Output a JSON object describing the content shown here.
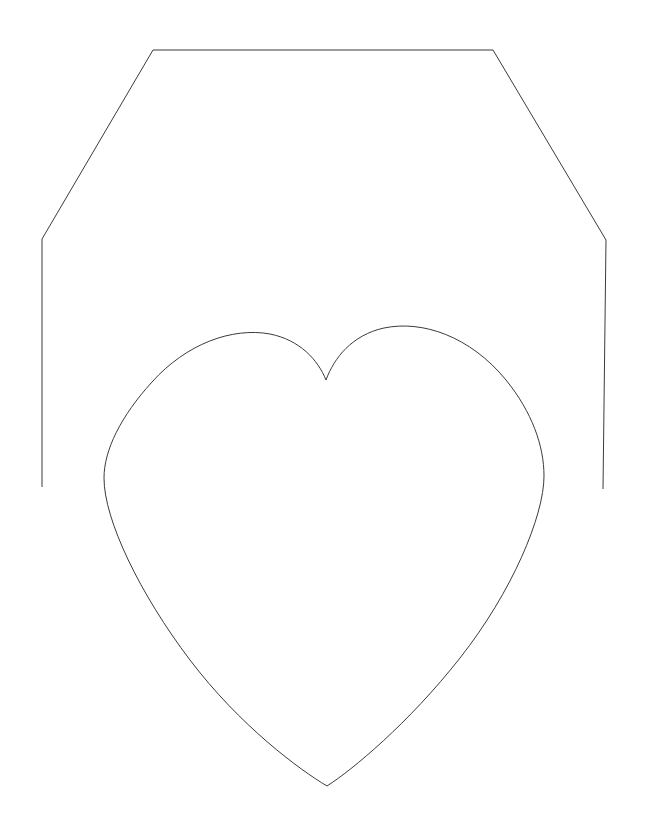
{
  "canvas": {
    "width": 645,
    "height": 837,
    "background_color": "#ffffff",
    "description": "Black-and-white line drawing: an open envelope / house-shaped outline with a large heart shape centered below"
  },
  "style": {
    "stroke_color": "#3b3b3b",
    "stroke_width": 1,
    "fill": "none"
  },
  "shapes": {
    "envelope": {
      "name": "envelope-outline",
      "type": "open-polyline",
      "stroke_color": "#3b3b3b",
      "stroke_width": 1,
      "points": [
        [
          42,
          487
        ],
        [
          42,
          239
        ],
        [
          153,
          50
        ],
        [
          493,
          50
        ],
        [
          606,
          240
        ],
        [
          603,
          489
        ]
      ],
      "path": "M 42 487 L 42 239 L 153 50 L 493 50 L 606 240 L 603 489"
    },
    "heart": {
      "name": "heart-outline",
      "type": "closed-curve",
      "stroke_color": "#3b3b3b",
      "stroke_width": 1,
      "key_points": {
        "top_notch": [
          326,
          380
        ],
        "left_lobe_apex": [
          227,
          340
        ],
        "leftmost": [
          104,
          470
        ],
        "bottom_point": [
          327,
          786
        ],
        "rightmost": [
          544,
          445
        ],
        "right_lobe_apex": [
          423,
          334
        ]
      },
      "path": "M 326 380 C 318 360 300 340 270 334 C 232 327 186 344 152 382 C 121 416 104 450 104 478 C 104 520 140 594 190 660 C 240 726 300 770 327 786 C 352 770 408 724 460 658 C 512 592 544 516 544 476 C 544 446 532 412 506 380 C 470 336 422 320 384 328 C 352 335 334 358 326 380 Z"
    }
  }
}
